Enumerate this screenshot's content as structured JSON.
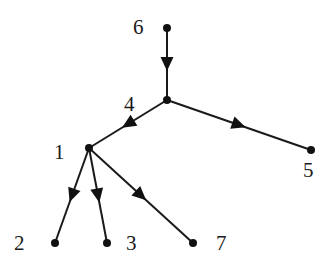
{
  "diagram": {
    "type": "directed-tree",
    "nodes": [
      {
        "id": "6",
        "label": "6",
        "x": 167,
        "y": 28,
        "lx": 133,
        "ly": 34
      },
      {
        "id": "4",
        "label": "4",
        "x": 167,
        "y": 100,
        "lx": 124,
        "ly": 111
      },
      {
        "id": "1",
        "label": "1",
        "x": 89,
        "y": 148,
        "lx": 54,
        "ly": 159
      },
      {
        "id": "5",
        "label": "5",
        "x": 311,
        "y": 150,
        "lx": 303,
        "ly": 177
      },
      {
        "id": "2",
        "label": "2",
        "x": 55,
        "y": 243,
        "lx": 14,
        "ly": 250
      },
      {
        "id": "3",
        "label": "3",
        "x": 107,
        "y": 243,
        "lx": 126,
        "ly": 250
      },
      {
        "id": "7",
        "label": "7",
        "x": 193,
        "y": 243,
        "lx": 216,
        "ly": 250
      }
    ],
    "edges": [
      {
        "from": "6",
        "to": "4"
      },
      {
        "from": "4",
        "to": "1"
      },
      {
        "from": "4",
        "to": "5"
      },
      {
        "from": "1",
        "to": "2"
      },
      {
        "from": "1",
        "to": "3"
      },
      {
        "from": "1",
        "to": "7"
      }
    ]
  }
}
